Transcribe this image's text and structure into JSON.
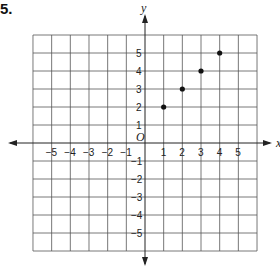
{
  "problem_number": "5.",
  "chart_data": {
    "type": "scatter",
    "title": "",
    "xlabel": "x",
    "ylabel": "y",
    "origin_label": "O",
    "xlim": [
      -6,
      6
    ],
    "ylim": [
      -6,
      6
    ],
    "grid": true,
    "x_ticks": [
      -5,
      -4,
      -3,
      -2,
      -1,
      1,
      2,
      3,
      4,
      5
    ],
    "y_ticks": [
      -5,
      -4,
      -3,
      -2,
      -1,
      1,
      2,
      3,
      4,
      5
    ],
    "series": [
      {
        "name": "points",
        "points": [
          [
            1,
            2
          ],
          [
            2,
            3
          ],
          [
            3,
            4
          ],
          [
            4,
            5
          ]
        ]
      }
    ]
  },
  "colors": {
    "grid": "#555555",
    "axis": "#222222",
    "point": "#111111"
  }
}
